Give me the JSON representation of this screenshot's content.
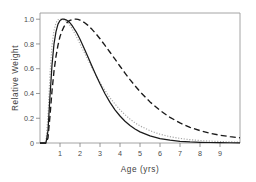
{
  "figure": {
    "background_color": "#ffffff",
    "frame_color": "#9a9a9a"
  },
  "axes": {
    "x_title": "Age  (yrs)",
    "y_title": "Relative Weight",
    "x_ticks": [
      "1",
      "2",
      "3",
      "4",
      "5",
      "6",
      "7",
      "8",
      "9"
    ],
    "y_ticks": [
      "1.0",
      "0.8",
      "0.6",
      "0.4",
      "0.2",
      "0"
    ]
  },
  "chart_data": {
    "type": "line",
    "title": "",
    "xlabel": "Age  (yrs)",
    "ylabel": "Relative Weight",
    "xlim": [
      0,
      10
    ],
    "ylim": [
      0,
      1.05
    ],
    "grid": false,
    "legend": "none",
    "x": [
      0.0,
      0.2,
      0.3,
      0.4,
      0.5,
      0.6,
      0.7,
      0.8,
      0.9,
      1.0,
      1.1,
      1.2,
      1.3,
      1.4,
      1.5,
      1.6,
      1.7,
      1.8,
      1.9,
      2.0,
      2.2,
      2.4,
      2.6,
      2.8,
      3.0,
      3.25,
      3.5,
      3.75,
      4.0,
      4.25,
      4.5,
      4.75,
      5.0,
      5.5,
      6.0,
      6.5,
      7.0,
      7.5,
      8.0,
      8.5,
      9.0,
      9.5,
      10.0
    ],
    "series": [
      {
        "name": "dotted-gray-curve",
        "style": "dotted",
        "color": "#a8a8a8",
        "peak_x": 1.05,
        "peak_y": 1.0,
        "values": [
          0.0,
          0.0,
          0.02,
          0.22,
          0.56,
          0.79,
          0.91,
          0.97,
          0.995,
          1.0,
          1.0,
          0.995,
          0.985,
          0.97,
          0.95,
          0.925,
          0.895,
          0.865,
          0.835,
          0.8,
          0.735,
          0.67,
          0.605,
          0.545,
          0.49,
          0.425,
          0.365,
          0.315,
          0.268,
          0.228,
          0.193,
          0.163,
          0.138,
          0.099,
          0.071,
          0.051,
          0.037,
          0.027,
          0.02,
          0.015,
          0.012,
          0.009,
          0.007
        ]
      },
      {
        "name": "solid-black-curve",
        "style": "solid",
        "color": "#1a1a1a",
        "peak_x": 1.25,
        "peak_y": 1.0,
        "values": [
          0.0,
          0.0,
          0.0,
          0.1,
          0.38,
          0.63,
          0.8,
          0.9,
          0.96,
          0.99,
          1.0,
          1.0,
          0.995,
          0.985,
          0.97,
          0.95,
          0.925,
          0.9,
          0.87,
          0.838,
          0.768,
          0.695,
          0.62,
          0.548,
          0.478,
          0.398,
          0.328,
          0.268,
          0.218,
          0.176,
          0.141,
          0.113,
          0.09,
          0.057,
          0.036,
          0.023,
          0.014,
          0.009,
          0.006,
          0.004,
          0.003,
          0.002,
          0.002
        ]
      },
      {
        "name": "dashed-black-curve",
        "style": "dashed",
        "color": "#1a1a1a",
        "peak_x": 1.75,
        "peak_y": 1.0,
        "values": [
          0.0,
          0.0,
          0.0,
          0.04,
          0.22,
          0.42,
          0.58,
          0.7,
          0.79,
          0.86,
          0.905,
          0.94,
          0.965,
          0.98,
          0.99,
          0.997,
          1.0,
          1.0,
          0.998,
          0.993,
          0.975,
          0.95,
          0.918,
          0.882,
          0.842,
          0.788,
          0.733,
          0.677,
          0.62,
          0.565,
          0.512,
          0.462,
          0.415,
          0.332,
          0.263,
          0.207,
          0.162,
          0.127,
          0.1,
          0.079,
          0.063,
          0.051,
          0.042
        ]
      }
    ]
  }
}
